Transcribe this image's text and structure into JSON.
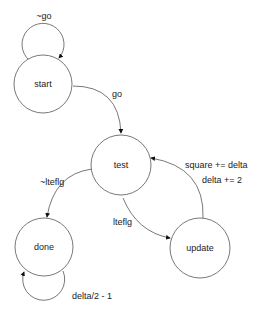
{
  "diagram": {
    "type": "state-machine",
    "states": [
      {
        "id": "start",
        "label": "start"
      },
      {
        "id": "test",
        "label": "test"
      },
      {
        "id": "done",
        "label": "done"
      },
      {
        "id": "update",
        "label": "update"
      }
    ],
    "transitions": [
      {
        "from": "start",
        "to": "start",
        "label": "~go"
      },
      {
        "from": "start",
        "to": "test",
        "label": "go"
      },
      {
        "from": "test",
        "to": "done",
        "label": "~lteflg"
      },
      {
        "from": "test",
        "to": "update",
        "label": "lteflg"
      },
      {
        "from": "update",
        "to": "test",
        "label_line1": "square += delta",
        "label_line2": "delta += 2"
      },
      {
        "from": "done",
        "to": "done",
        "label": "delta/2 - 1"
      }
    ]
  }
}
